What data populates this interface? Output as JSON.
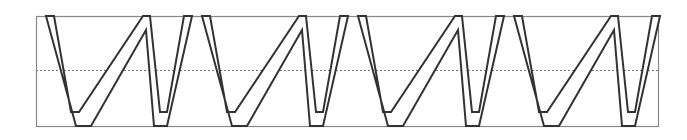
{
  "worksheet": {
    "letter": "W",
    "repeat_count": 4,
    "letters": [
      "W",
      "W",
      "W",
      "W"
    ],
    "colors": {
      "box_border": "#888888",
      "guide_line": "#777777",
      "letter_outline": "#333333",
      "letter_fill": "#ffffff"
    }
  }
}
